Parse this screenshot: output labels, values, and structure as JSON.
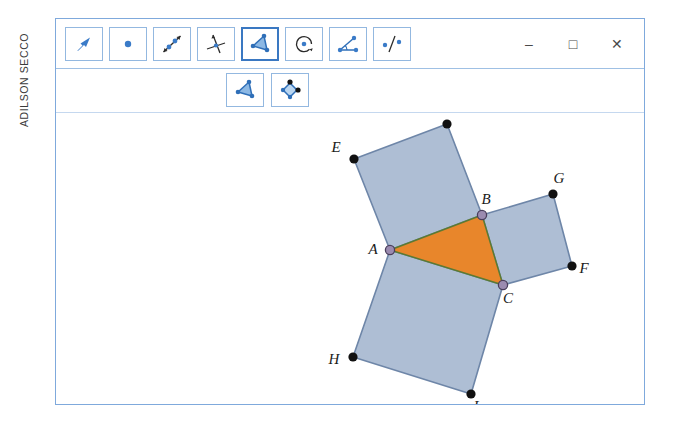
{
  "credit": {
    "text": "ADILSON SECCO"
  },
  "window": {
    "controls": [
      {
        "name": "minimize",
        "glyph": "–"
      },
      {
        "name": "maximize",
        "glyph": "□"
      },
      {
        "name": "close",
        "glyph": "✕"
      }
    ]
  },
  "toolbar": {
    "primary": [
      {
        "id": "move",
        "icon": "arrow-pointer-icon",
        "label": "Mover",
        "selected": false
      },
      {
        "id": "point",
        "icon": "point-icon",
        "label": "Ponto",
        "selected": false
      },
      {
        "id": "line",
        "icon": "line-through-points-icon",
        "label": "Reta",
        "selected": false
      },
      {
        "id": "perpendicular",
        "icon": "perpendicular-line-icon",
        "label": "Reta Perpendicular",
        "selected": false
      },
      {
        "id": "polygon",
        "icon": "polygon-icon",
        "label": "Polígono",
        "selected": true
      },
      {
        "id": "circle",
        "icon": "circle-center-point-icon",
        "label": "Círculo",
        "selected": false
      },
      {
        "id": "angle",
        "icon": "angle-icon",
        "label": "Ângulo",
        "selected": false
      },
      {
        "id": "reflect",
        "icon": "reflect-about-line-icon",
        "label": "Reflexão",
        "selected": false
      }
    ],
    "secondary": [
      {
        "id": "polygon-sub",
        "icon": "polygon-icon",
        "label": "Polígono",
        "selected": false
      },
      {
        "id": "rigid-polygon-sub",
        "icon": "rigid-polygon-icon",
        "label": "Polígono Rígido",
        "selected": false
      }
    ]
  },
  "colors": {
    "square_fill": "#AEBED4",
    "square_stroke": "#6E86A8",
    "triangle_fill": "#E8862B",
    "triangle_stroke": "#5B7A33",
    "free_point": "#111111",
    "vertex_point": "#9B8BB0",
    "frame": "#7FA9DC",
    "tool_border": "#93B8E0",
    "tool_selected_border": "#3A78C2",
    "icon_blue": "#3A7BC8",
    "icon_light_blue": "#8CB8E4"
  },
  "figure": {
    "points": [
      {
        "id": "A",
        "label": "A",
        "x": 334,
        "y": 137,
        "type": "vertex",
        "label_dx": -17,
        "label_dy": 4
      },
      {
        "id": "B",
        "label": "B",
        "x": 426,
        "y": 102,
        "type": "vertex",
        "label_dx": 4,
        "label_dy": -11
      },
      {
        "id": "C",
        "label": "C",
        "x": 447,
        "y": 172,
        "type": "vertex",
        "label_dx": 5,
        "label_dy": 18
      },
      {
        "id": "D",
        "label": "D",
        "x": 391,
        "y": 11,
        "type": "free",
        "label_dx": 2,
        "label_dy": -11
      },
      {
        "id": "E",
        "label": "E",
        "x": 298,
        "y": 46,
        "type": "free",
        "label_dx": -18,
        "label_dy": -7
      },
      {
        "id": "F",
        "label": "F",
        "x": 516,
        "y": 153,
        "type": "free",
        "label_dx": 12,
        "label_dy": 7
      },
      {
        "id": "G",
        "label": "G",
        "x": 497,
        "y": 81,
        "type": "free",
        "label_dx": 6,
        "label_dy": -11
      },
      {
        "id": "H",
        "label": "H",
        "x": 297,
        "y": 244,
        "type": "free",
        "label_dx": -19,
        "label_dy": 7
      },
      {
        "id": "I",
        "label": "I",
        "x": 415,
        "y": 281,
        "type": "free",
        "label_dx": 5,
        "label_dy": 17
      }
    ],
    "squares": [
      {
        "id": "square-ABDE",
        "vertices": [
          "A",
          "B",
          "D",
          "E"
        ]
      },
      {
        "id": "square-BCFG",
        "vertices": [
          "B",
          "C",
          "F",
          "G"
        ]
      },
      {
        "id": "square-ACIH",
        "vertices": [
          "A",
          "C",
          "I",
          "H"
        ]
      }
    ],
    "triangle": {
      "id": "triangle-ABC",
      "vertices": [
        "A",
        "B",
        "C"
      ]
    }
  }
}
